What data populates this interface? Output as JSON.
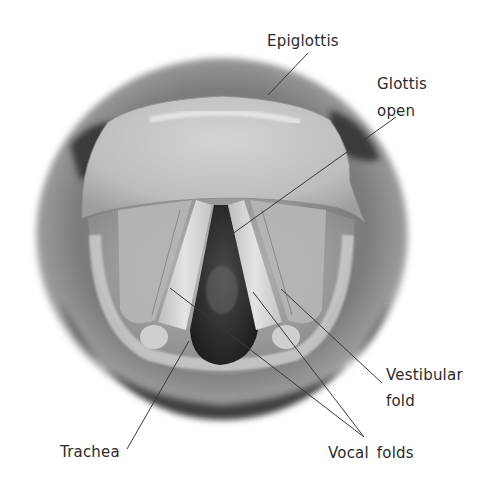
{
  "figure": {
    "labels": {
      "epiglottis": "Epiglottis",
      "glottis_line1": "Glottis",
      "glottis_line2": "open",
      "vestibular_line1": "Vestibular",
      "vestibular_line2": "fold",
      "vocal_folds": "Vocal folds",
      "trachea": "Trachea"
    },
    "colors": {
      "background": "#ffffff",
      "text": "#2b2b2b",
      "leader_line": "#3a3a3a",
      "tissue_light": "#d8d8d8",
      "tissue_mid": "#9a9a9a",
      "tissue_dark": "#3c3c3c",
      "airway_dark": "#2a2a2a"
    }
  }
}
